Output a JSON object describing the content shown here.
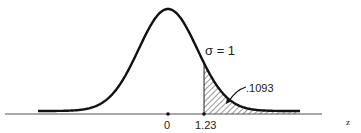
{
  "chart_data": {
    "type": "area",
    "title": "",
    "distribution": "standard normal",
    "xlabel": "z",
    "ylabel": "",
    "mean": 0,
    "sigma": 1,
    "sigma_label": "σ = 1",
    "tick_labels": [
      "0",
      "1.23"
    ],
    "ticks": [
      0,
      1.23
    ],
    "shaded_region": {
      "from": 1.23,
      "to": "inf",
      "area": 0.1093,
      "label": ".1093",
      "style": "hatched"
    },
    "xlim": [
      -4.4,
      5.3
    ],
    "grid": false,
    "legend": null
  },
  "colors": {
    "line": "#111111",
    "axis": "#555555",
    "hatch": "#333333",
    "background": "#ffffff"
  }
}
